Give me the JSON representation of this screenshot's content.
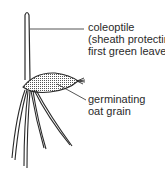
{
  "diagram": {
    "type": "labelled-illustration",
    "labels": {
      "coleoptile": {
        "lines": [
          "coleoptile",
          "(sheath protecting",
          "first green leaves)"
        ]
      },
      "grain": {
        "lines": [
          "germinating",
          "oat grain"
        ]
      }
    },
    "colors": {
      "ink": "#2a2a2a",
      "background": "#ffffff"
    }
  }
}
